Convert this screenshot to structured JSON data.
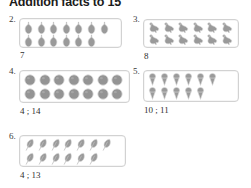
{
  "worksheet": {
    "title": "Addition facts to 15",
    "problems": [
      {
        "number": "2.",
        "icon": "pear-icon",
        "rows": [
          7,
          6
        ],
        "total": 13,
        "answer": "7"
      },
      {
        "number": "3.",
        "icon": "bird-icon",
        "rows": [
          6,
          6
        ],
        "total": 12,
        "answer": "8"
      },
      {
        "number": "4.",
        "icon": "circle-icon",
        "rows": [
          7,
          7
        ],
        "total": 14,
        "answer": "4 ; 14"
      },
      {
        "number": "5.",
        "icon": "cone-icon",
        "rows": [
          6,
          5
        ],
        "total": 11,
        "answer": "10 ; 11"
      },
      {
        "number": "6.",
        "icon": "leaf-icon",
        "rows": [
          7,
          6
        ],
        "total": 13,
        "answer": "4 ; 13"
      }
    ]
  },
  "colors": {
    "object_fill": "#9a9a9a",
    "object_stroke": "#cfcfcf",
    "box_border": "#d2d2d2",
    "text": "#2f2f2f",
    "title": "#1b1b1b"
  }
}
